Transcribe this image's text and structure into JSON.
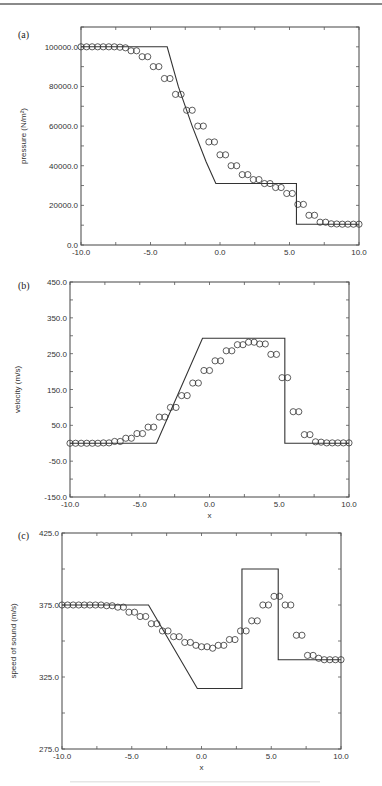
{
  "figure": {
    "panels": [
      {
        "label": "(a)",
        "xlabel": "x",
        "ylabel_html": "pressure (N/m²)"
      },
      {
        "label": "(b)",
        "xlabel": "x",
        "ylabel_html": "velocity (m/s)"
      },
      {
        "label": "(c)",
        "xlabel": "x",
        "ylabel_html": "speed of sound (m/s)"
      }
    ]
  },
  "chart_data": [
    {
      "type": "line",
      "title": "(a)",
      "xlabel": "x",
      "ylabel": "pressure (N/m^2)",
      "xlim": [
        -10,
        10
      ],
      "ylim": [
        0,
        110000
      ],
      "xticks": [
        -10,
        -5,
        0,
        5,
        10
      ],
      "xtick_labels": [
        "-10.0",
        "-5.0",
        "0.0",
        "5.0",
        "10.0"
      ],
      "yticks": [
        0,
        20000,
        40000,
        60000,
        80000,
        100000
      ],
      "ytick_labels": [
        "0.0",
        "20000.0",
        "40000.0",
        "60000.0",
        "80000.0",
        "100000.0"
      ],
      "grid": false,
      "legend": null,
      "series": [
        {
          "name": "exact solution",
          "style": "solid line",
          "x": [
            -10,
            -3.8,
            -3.0,
            -2.0,
            -1.0,
            -0.3,
            5.5,
            5.5,
            10
          ],
          "y": [
            100000,
            100000,
            80000,
            60000,
            42000,
            31000,
            31000,
            10500,
            10500
          ]
        },
        {
          "name": "numerical solution",
          "style": "open circle markers",
          "x": [
            -10.0,
            -9.6,
            -9.2,
            -8.8,
            -8.4,
            -8.0,
            -7.6,
            -7.2,
            -6.8,
            -6.4,
            -6.0,
            -5.6,
            -5.2,
            -4.8,
            -4.4,
            -4.0,
            -3.6,
            -3.2,
            -2.8,
            -2.4,
            -2.0,
            -1.6,
            -1.2,
            -0.8,
            -0.4,
            0.0,
            0.4,
            0.8,
            1.2,
            1.6,
            2.0,
            2.4,
            2.8,
            3.2,
            3.6,
            4.0,
            4.4,
            4.8,
            5.2,
            5.6,
            6.0,
            6.4,
            6.8,
            7.2,
            7.6,
            8.0,
            8.4,
            8.8,
            9.2,
            9.6,
            10.0
          ],
          "y": [
            100000,
            100000,
            100000,
            100000,
            100000,
            100000,
            100000,
            99800,
            99500,
            98000,
            98000,
            95000,
            95000,
            90000,
            90000,
            84000,
            84000,
            76000,
            76000,
            68000,
            68000,
            60000,
            60000,
            52000,
            52000,
            45500,
            45500,
            40000,
            40000,
            35500,
            35500,
            33000,
            33000,
            31000,
            31000,
            29000,
            29000,
            26000,
            26000,
            20500,
            20500,
            15000,
            15000,
            11500,
            11500,
            10700,
            10600,
            10500,
            10500,
            10500,
            10500
          ]
        }
      ]
    },
    {
      "type": "line",
      "title": "(b)",
      "xlabel": "x",
      "ylabel": "velocity (m/s)",
      "xlim": [
        -10,
        10
      ],
      "ylim": [
        -150,
        450
      ],
      "xticks": [
        -10,
        -5,
        0,
        5,
        10
      ],
      "xtick_labels": [
        "-10.0",
        "-5.0",
        "0.0",
        "5.0",
        "10.0"
      ],
      "yticks": [
        -150,
        -50,
        50,
        150,
        250,
        350,
        450
      ],
      "ytick_labels": [
        "-150.0",
        "-50.0",
        "50.0",
        "150.0",
        "250.0",
        "350.0",
        "450.0"
      ],
      "grid": false,
      "legend": null,
      "series": [
        {
          "name": "exact solution",
          "style": "solid line",
          "x": [
            -10,
            -3.8,
            -0.5,
            5.4,
            5.4,
            10
          ],
          "y": [
            0,
            0,
            293,
            293,
            0,
            0
          ]
        },
        {
          "name": "numerical solution",
          "style": "open circle markers",
          "x": [
            -10.0,
            -9.6,
            -9.2,
            -8.8,
            -8.4,
            -8.0,
            -7.6,
            -7.2,
            -6.8,
            -6.4,
            -6.0,
            -5.6,
            -5.2,
            -4.8,
            -4.4,
            -4.0,
            -3.6,
            -3.2,
            -2.8,
            -2.4,
            -2.0,
            -1.6,
            -1.2,
            -0.8,
            -0.4,
            0.0,
            0.4,
            0.8,
            1.2,
            1.6,
            2.0,
            2.4,
            2.8,
            3.2,
            3.6,
            4.0,
            4.4,
            4.8,
            5.2,
            5.6,
            6.0,
            6.4,
            6.8,
            7.2,
            7.6,
            8.0,
            8.4,
            8.8,
            9.2,
            9.6,
            10.0
          ],
          "y": [
            0,
            0,
            0,
            0,
            0,
            0,
            1,
            1,
            5,
            5,
            14,
            14,
            27,
            27,
            45,
            45,
            73,
            73,
            100,
            100,
            133,
            133,
            168,
            168,
            203,
            203,
            230,
            230,
            258,
            258,
            275,
            275,
            282,
            282,
            277,
            277,
            248,
            248,
            183,
            183,
            88,
            88,
            24,
            24,
            4,
            3,
            1,
            1,
            1,
            1,
            1
          ]
        }
      ]
    },
    {
      "type": "line",
      "title": "(c)",
      "xlabel": "x",
      "ylabel": "speed of sound (m/s)",
      "xlim": [
        -10,
        10
      ],
      "ylim": [
        275,
        425
      ],
      "xticks": [
        -10,
        -5,
        0,
        5,
        10
      ],
      "xtick_labels": [
        "-10.0",
        "-5.0",
        "0.0",
        "5.0",
        "10.0"
      ],
      "yticks": [
        275,
        325,
        375,
        425
      ],
      "ytick_labels": [
        "275.0",
        "325.0",
        "375.0",
        "425.0"
      ],
      "grid": false,
      "legend": null,
      "series": [
        {
          "name": "exact solution",
          "style": "solid line",
          "x": [
            -10,
            -3.8,
            -0.3,
            2.9,
            2.9,
            5.5,
            5.5,
            10
          ],
          "y": [
            375,
            375,
            317,
            317,
            400,
            400,
            337,
            337
          ]
        },
        {
          "name": "numerical solution",
          "style": "open circle markers",
          "x": [
            -10.0,
            -9.6,
            -9.2,
            -8.8,
            -8.4,
            -8.0,
            -7.6,
            -7.2,
            -6.8,
            -6.4,
            -6.0,
            -5.6,
            -5.2,
            -4.8,
            -4.4,
            -4.0,
            -3.6,
            -3.2,
            -2.8,
            -2.4,
            -2.0,
            -1.6,
            -1.2,
            -0.8,
            -0.4,
            0.0,
            0.4,
            0.8,
            1.2,
            1.6,
            2.0,
            2.4,
            2.8,
            3.2,
            3.6,
            4.0,
            4.4,
            4.8,
            5.2,
            5.6,
            6.0,
            6.4,
            6.8,
            7.2,
            7.6,
            8.0,
            8.4,
            8.8,
            9.2,
            9.6,
            10.0
          ],
          "y": [
            375,
            375,
            375,
            375,
            375,
            375,
            375,
            375,
            374.5,
            374.5,
            373.5,
            373.5,
            370,
            370,
            367,
            367,
            362,
            362,
            357,
            357,
            353,
            353,
            349,
            349,
            347,
            346,
            346,
            345,
            347,
            347,
            351,
            351,
            357,
            357,
            364,
            364,
            375,
            375,
            381,
            381,
            375,
            375,
            354,
            354,
            340,
            340,
            338,
            337,
            337,
            337,
            337
          ]
        }
      ]
    }
  ]
}
